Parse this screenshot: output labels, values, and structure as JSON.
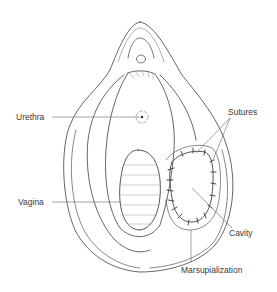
{
  "diagram": {
    "type": "anatomical-illustration",
    "colors": {
      "background": "#ffffff",
      "line": "#555555",
      "label_text": "#3a3a3a",
      "leader_line": "#666666"
    },
    "labels": [
      {
        "id": "urethra",
        "text": "Urethra",
        "x": 16,
        "y": 112,
        "target": [
          141,
          117
        ]
      },
      {
        "id": "sutures",
        "text": "Sutures",
        "x": 228,
        "y": 107,
        "targets": [
          [
            196,
            153
          ],
          [
            213,
            160
          ]
        ]
      },
      {
        "id": "vagina",
        "text": "Vagina",
        "x": 18,
        "y": 198,
        "target": [
          121,
          202
        ]
      },
      {
        "id": "cavity",
        "text": "Cavity",
        "x": 229,
        "y": 228,
        "target": [
          190,
          187
        ]
      },
      {
        "id": "marsupialization",
        "text": "Marsupialization",
        "x": 181,
        "y": 265,
        "target": [
          191,
          230
        ]
      }
    ]
  }
}
